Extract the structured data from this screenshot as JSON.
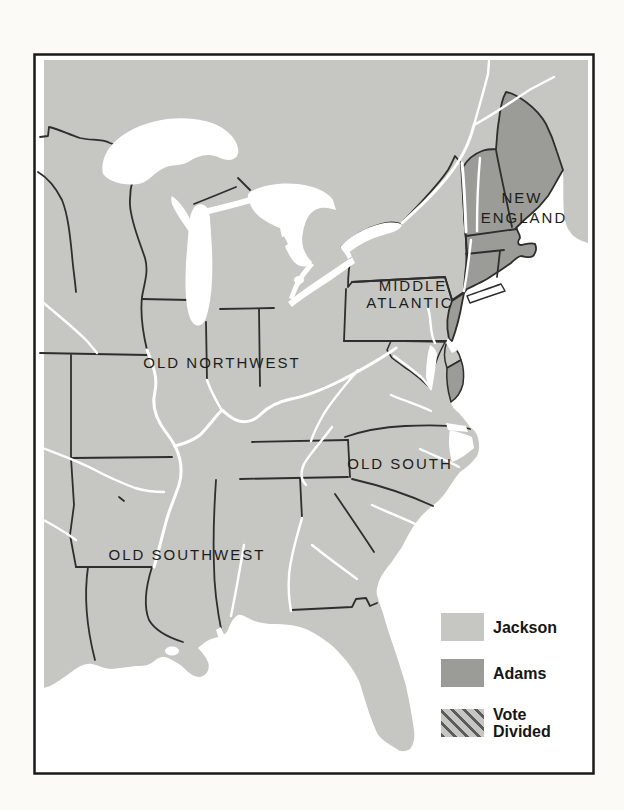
{
  "map": {
    "title": "Election of 1828 regional results map",
    "region_labels": {
      "new_england_line1": "NEW",
      "new_england_line2": "ENGLAND",
      "middle_atlantic_line1": "MIDDLE",
      "middle_atlantic_line2": "ATLANTIC",
      "old_northwest": "OLD NORTHWEST",
      "old_south": "OLD SOUTH",
      "old_southwest": "OLD SOUTHWEST"
    }
  },
  "legend": {
    "items": [
      {
        "label": "Jackson",
        "swatch": "jackson"
      },
      {
        "label": "Adams",
        "swatch": "adams"
      },
      {
        "label": "Vote\nDivided",
        "swatch": "vote-divided"
      }
    ]
  },
  "colors": {
    "jackson": "#c6c7c3",
    "adams": "#9b9b97",
    "hatch_stripe": "#5c5c5a",
    "border_line": "#2e2e2c",
    "water": "#ffffff",
    "frame": "#1a1a1a",
    "label_text": "#1d1d1b"
  }
}
